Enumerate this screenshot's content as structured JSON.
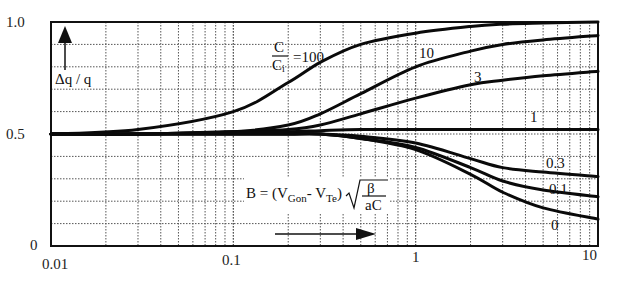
{
  "chart_data": {
    "type": "line",
    "title": "",
    "xlabel": "B = (V_Gon - V_Te) sqrt(beta / aC)",
    "ylabel": "Δq / q",
    "xscale": "log",
    "xlim": [
      0.01,
      10
    ],
    "ylim": [
      0,
      1.0
    ],
    "grid": true,
    "x_ticks": [
      "0.01",
      "0.1",
      "1",
      "10"
    ],
    "y_ticks": [
      "0",
      "0.5",
      "1.0"
    ],
    "parameter_label": "C / Ci",
    "x": [
      0.01,
      0.03,
      0.1,
      0.2,
      0.3,
      0.5,
      1,
      2,
      3,
      5,
      10
    ],
    "series": [
      {
        "name": "100",
        "values": [
          0.5,
          0.52,
          0.6,
          0.73,
          0.82,
          0.9,
          0.95,
          0.98,
          0.99,
          0.995,
          1.0
        ]
      },
      {
        "name": "10",
        "values": [
          0.5,
          0.5,
          0.51,
          0.54,
          0.59,
          0.68,
          0.8,
          0.87,
          0.9,
          0.92,
          0.94
        ]
      },
      {
        "name": "3",
        "values": [
          0.5,
          0.5,
          0.51,
          0.52,
          0.54,
          0.59,
          0.66,
          0.72,
          0.74,
          0.76,
          0.78
        ]
      },
      {
        "name": "1",
        "values": [
          0.5,
          0.5,
          0.51,
          0.51,
          0.515,
          0.52,
          0.52,
          0.52,
          0.52,
          0.52,
          0.52
        ]
      },
      {
        "name": "0.3",
        "values": [
          0.5,
          0.5,
          0.5,
          0.5,
          0.5,
          0.49,
          0.46,
          0.39,
          0.35,
          0.33,
          0.31
        ]
      },
      {
        "name": "0.1",
        "values": [
          0.5,
          0.5,
          0.5,
          0.5,
          0.5,
          0.48,
          0.44,
          0.35,
          0.29,
          0.25,
          0.22
        ]
      },
      {
        "name": "0",
        "values": [
          0.5,
          0.5,
          0.5,
          0.5,
          0.5,
          0.48,
          0.43,
          0.32,
          0.24,
          0.17,
          0.12
        ]
      }
    ],
    "annotations": [
      {
        "text": "C/Ci =100",
        "near_series": "100"
      },
      {
        "text": "10",
        "near_series": "10"
      },
      {
        "text": "3",
        "near_series": "3"
      },
      {
        "text": "1",
        "near_series": "1"
      },
      {
        "text": "0.3",
        "near_series": "0.3"
      },
      {
        "text": "0.1",
        "near_series": "0.1"
      },
      {
        "text": "0",
        "near_series": "0"
      }
    ]
  },
  "labels": {
    "y_axis": "Δq / q",
    "frac_num": "C",
    "frac_den": "C",
    "frac_den_sub": "i",
    "frac_eq": "=100",
    "s10": "10",
    "s3": "3",
    "s1": "1",
    "s03": "0.3",
    "s01": "0.1",
    "s0": "0",
    "formula_B": "B = (V",
    "formula_gon": "Gon",
    "formula_dash": "- V",
    "formula_te": "Te",
    "formula_close": ")",
    "formula_beta": "β",
    "formula_ac": "aC",
    "xt0": "0.01",
    "xt1": "0.1",
    "xt2": "1",
    "xt3": "10",
    "yt0": "0",
    "yt1": "0.5",
    "yt2": "1.0"
  }
}
